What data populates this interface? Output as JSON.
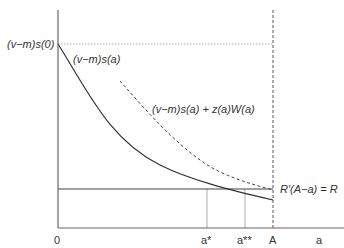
{
  "diagram": {
    "type": "economic-diagram",
    "axes": {
      "x_label": "a",
      "origin_label": "0"
    },
    "y_intercept_label": "(v−m)s(0)",
    "curves": [
      {
        "name": "solid-curve",
        "label": "(v−m)s(a)",
        "style": "solid"
      },
      {
        "name": "dashed-curve",
        "label": "(v−m)s(a) + z(a)W(a)",
        "style": "dashed"
      }
    ],
    "horizontal_line": {
      "label": "R′(A−a) = R"
    },
    "x_ticks": {
      "a_star": "a*",
      "a_star_star": "a**",
      "A": "A"
    },
    "colors": {
      "axis": "#555555",
      "curve": "#333333",
      "guide": "#888888"
    }
  }
}
